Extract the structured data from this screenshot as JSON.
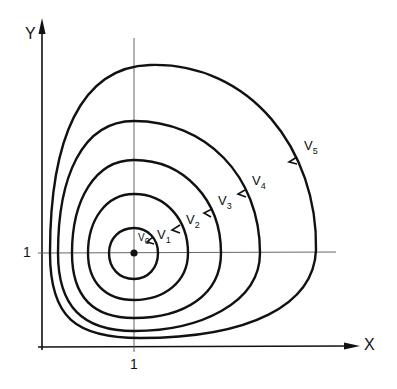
{
  "diagram": {
    "type": "level-curves",
    "axes": {
      "x_label": "X",
      "y_label": "Y",
      "x_tick": "1",
      "y_tick": "1"
    },
    "center": {
      "x": 1,
      "y": 1
    },
    "curves": [
      {
        "label": "V",
        "sub": "0"
      },
      {
        "label": "V",
        "sub": "1"
      },
      {
        "label": "V",
        "sub": "2"
      },
      {
        "label": "V",
        "sub": "3"
      },
      {
        "label": "V",
        "sub": "4"
      },
      {
        "label": "V",
        "sub": "5"
      }
    ],
    "direction_marker": "<",
    "colors": {
      "stroke": "#111111",
      "gridline": "#555555",
      "background": "#ffffff"
    }
  }
}
